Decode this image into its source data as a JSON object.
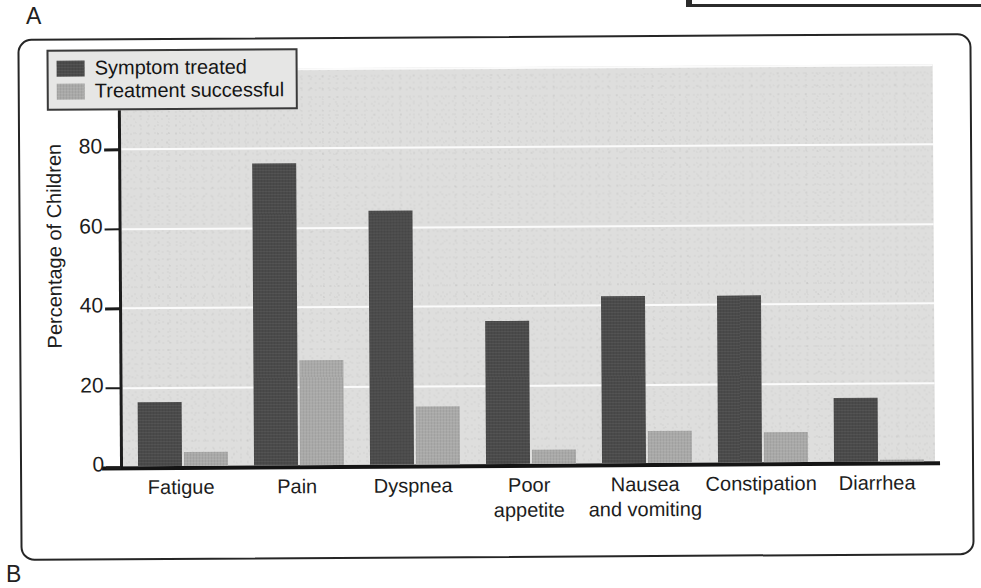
{
  "figure": {
    "panel_a_label": "A",
    "panel_b_label": "B"
  },
  "chart_data": {
    "type": "bar",
    "title": "",
    "xlabel": "",
    "ylabel": "Percentage of Children",
    "ylim": [
      0,
      100
    ],
    "yticks": [
      0,
      20,
      40,
      60,
      80,
      100
    ],
    "ytick_labels": [
      "0",
      "20",
      "40",
      "60",
      "80",
      "100"
    ],
    "grid": true,
    "grid_orientation": "horizontal",
    "legend_position": "top-left",
    "categories": [
      "Fatigue",
      "Pain",
      "Dyspnea",
      "Poor appetite",
      "Nausea and vomiting",
      "Constipation",
      "Diarrhea"
    ],
    "category_label_lines": [
      [
        "Fatigue"
      ],
      [
        "Pain"
      ],
      [
        "Dyspnea"
      ],
      [
        "Poor",
        "appetite"
      ],
      [
        "Nausea",
        "and vomiting"
      ],
      [
        "Constipation"
      ],
      [
        "Diarrhea"
      ]
    ],
    "series": [
      {
        "name": "Symptom treated",
        "color": "#4a4a4a",
        "values": [
          16,
          76,
          64,
          36,
          42,
          42,
          16
        ]
      },
      {
        "name": "Treatment successful",
        "color": "#a9a9a8",
        "values": [
          3.5,
          26.5,
          14.5,
          3.5,
          8,
          7.5,
          0.5
        ]
      }
    ]
  },
  "legend": {
    "items": [
      {
        "label": "Symptom treated",
        "color": "#4a4a4a"
      },
      {
        "label": "Treatment successful",
        "color": "#a9a9a8"
      }
    ]
  },
  "colors": {
    "plot_background": "#dededd",
    "gridline": "#fbfbfb",
    "axis": "#1c1c1c",
    "frame": "#262626",
    "series_dark": "#4a4a4a",
    "series_light": "#a9a9a8"
  }
}
